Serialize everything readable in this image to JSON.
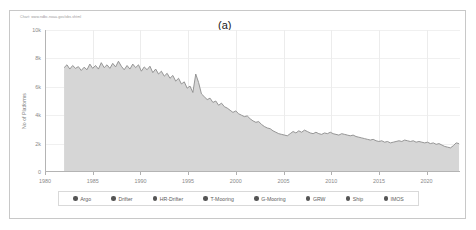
{
  "figure": {
    "panel_label": "(a)",
    "source_note": "Chart: www.ndbc.noaa.gov/obs.shtml"
  },
  "chart_data": {
    "type": "area",
    "title": "(a)",
    "xlabel": "",
    "ylabel": "No of Platforms",
    "xlim": [
      1980,
      2023.5
    ],
    "ylim": [
      0,
      10000
    ],
    "grid": true,
    "legend_position": "bottom",
    "xticks": [
      1980,
      1985,
      1990,
      1995,
      2000,
      2005,
      2010,
      2015,
      2020
    ],
    "xtick_labels": [
      "1980",
      "1985",
      "1990",
      "1995",
      "2000",
      "2005",
      "2010",
      "2015",
      "2020"
    ],
    "yticks": [
      0,
      2000,
      4000,
      6000,
      8000,
      10000
    ],
    "ytick_labels": [
      "0",
      "2k",
      "4k",
      "6k",
      "8k",
      "10k"
    ],
    "series": [
      {
        "name": "Total Platforms",
        "color": "#8c8c8c",
        "fill": "#d6d6d6",
        "x": [
          1982.0,
          1982.3,
          1982.6,
          1982.9,
          1983.2,
          1983.5,
          1983.8,
          1984.1,
          1984.4,
          1984.7,
          1985.0,
          1985.3,
          1985.6,
          1985.9,
          1986.2,
          1986.5,
          1986.8,
          1987.1,
          1987.4,
          1987.7,
          1988.0,
          1988.3,
          1988.6,
          1988.9,
          1989.2,
          1989.5,
          1989.8,
          1990.1,
          1990.4,
          1990.7,
          1991.0,
          1991.3,
          1991.6,
          1991.9,
          1992.2,
          1992.5,
          1992.8,
          1993.1,
          1993.4,
          1993.7,
          1994.0,
          1994.3,
          1994.6,
          1994.9,
          1995.2,
          1995.5,
          1995.8,
          1996.1,
          1996.4,
          1996.7,
          1997.0,
          1997.3,
          1997.6,
          1997.9,
          1998.2,
          1998.5,
          1998.8,
          1999.1,
          1999.4,
          1999.7,
          2000.0,
          2000.3,
          2000.6,
          2000.9,
          2001.2,
          2001.5,
          2001.8,
          2002.1,
          2002.4,
          2002.7,
          2003.0,
          2003.3,
          2003.6,
          2003.9,
          2004.2,
          2004.5,
          2004.8,
          2005.1,
          2005.4,
          2005.7,
          2006.0,
          2006.3,
          2006.6,
          2006.9,
          2007.2,
          2007.5,
          2007.8,
          2008.1,
          2008.4,
          2008.7,
          2009.0,
          2009.3,
          2009.6,
          2009.9,
          2010.2,
          2010.5,
          2010.8,
          2011.1,
          2011.4,
          2011.7,
          2012.0,
          2012.3,
          2012.6,
          2012.9,
          2013.2,
          2013.5,
          2013.8,
          2014.1,
          2014.4,
          2014.7,
          2015.0,
          2015.3,
          2015.6,
          2015.9,
          2016.2,
          2016.5,
          2016.8,
          2017.1,
          2017.4,
          2017.7,
          2018.0,
          2018.3,
          2018.6,
          2018.9,
          2019.2,
          2019.5,
          2019.8,
          2020.1,
          2020.4,
          2020.7,
          2021.0,
          2021.3,
          2021.6,
          2021.9,
          2022.2,
          2022.5,
          2022.8,
          2023.1,
          2023.4
        ],
        "y": [
          7350,
          7550,
          7250,
          7500,
          7300,
          7420,
          7150,
          7380,
          7200,
          7600,
          7300,
          7500,
          7250,
          7700,
          7350,
          7550,
          7300,
          7650,
          7400,
          7800,
          7450,
          7200,
          7500,
          7250,
          7600,
          7350,
          7550,
          7100,
          7400,
          7200,
          7450,
          7000,
          7250,
          6900,
          7100,
          6750,
          6950,
          6600,
          6800,
          6400,
          6600,
          6200,
          6350,
          5900,
          6050,
          5600,
          6900,
          6300,
          5500,
          5300,
          5100,
          5200,
          4900,
          5000,
          4700,
          4850,
          4600,
          4500,
          4350,
          4200,
          4300,
          4100,
          4000,
          3900,
          3950,
          3750,
          3600,
          3500,
          3550,
          3350,
          3200,
          3100,
          3050,
          2900,
          2800,
          2700,
          2650,
          2600,
          2550,
          2700,
          2850,
          2750,
          2900,
          2800,
          2950,
          2850,
          2750,
          2700,
          2800,
          2700,
          2650,
          2750,
          2700,
          2800,
          2700,
          2650,
          2600,
          2700,
          2650,
          2600,
          2550,
          2600,
          2500,
          2450,
          2400,
          2350,
          2300,
          2250,
          2300,
          2200,
          2150,
          2200,
          2100,
          2150,
          2050,
          2100,
          2150,
          2200,
          2150,
          2250,
          2200,
          2150,
          2200,
          2100,
          2150,
          2100,
          2050,
          2100,
          2000,
          2050,
          1950,
          2000,
          1900,
          1800,
          1750,
          1700,
          1850,
          2050,
          2000
        ]
      }
    ],
    "legend": [
      {
        "label": "Argo",
        "color": "#555555"
      },
      {
        "label": "Drifter",
        "color": "#555555"
      },
      {
        "label": "HR-Drifter",
        "color": "#555555"
      },
      {
        "label": "T-Mooring",
        "color": "#555555"
      },
      {
        "label": "G-Mooring",
        "color": "#555555"
      },
      {
        "label": "GRW",
        "color": "#555555"
      },
      {
        "label": "Ship",
        "color": "#555555"
      },
      {
        "label": "IMOS",
        "color": "#555555"
      }
    ]
  }
}
